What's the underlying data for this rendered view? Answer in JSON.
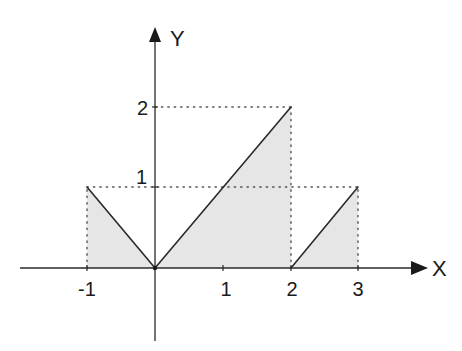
{
  "diagram": {
    "type": "piecewise-function-plot",
    "axes": {
      "x_label": "X",
      "y_label": "Y",
      "x_ticks": [
        "-1",
        "1",
        "2",
        "3"
      ],
      "y_ticks": [
        "1",
        "2"
      ]
    },
    "segments": [
      {
        "from": [
          -1,
          1
        ],
        "to": [
          0,
          0
        ]
      },
      {
        "from": [
          0,
          0
        ],
        "to": [
          2,
          2
        ]
      },
      {
        "from": [
          2,
          0
        ],
        "to": [
          3,
          1
        ]
      }
    ],
    "shaded_regions": [
      {
        "vertices": [
          [
            -1,
            0
          ],
          [
            -1,
            1
          ],
          [
            0,
            0
          ]
        ]
      },
      {
        "vertices": [
          [
            0,
            0
          ],
          [
            2,
            2
          ],
          [
            2,
            0
          ]
        ]
      },
      {
        "vertices": [
          [
            2,
            0
          ],
          [
            3,
            1
          ],
          [
            3,
            0
          ]
        ]
      }
    ],
    "guide_lines": [
      {
        "from": [
          -1,
          1
        ],
        "to": [
          3,
          1
        ],
        "style": "dotted"
      },
      {
        "from": [
          0,
          2
        ],
        "to": [
          2,
          2
        ],
        "style": "dotted"
      },
      {
        "from": [
          -1,
          0
        ],
        "to": [
          -1,
          1
        ],
        "style": "dotted"
      },
      {
        "from": [
          2,
          0
        ],
        "to": [
          2,
          2
        ],
        "style": "dotted"
      },
      {
        "from": [
          3,
          0
        ],
        "to": [
          3,
          1
        ],
        "style": "dotted"
      }
    ],
    "colors": {
      "line": "#2a2a2a",
      "fill": "#e6e6e6",
      "dots": "#555555"
    }
  }
}
